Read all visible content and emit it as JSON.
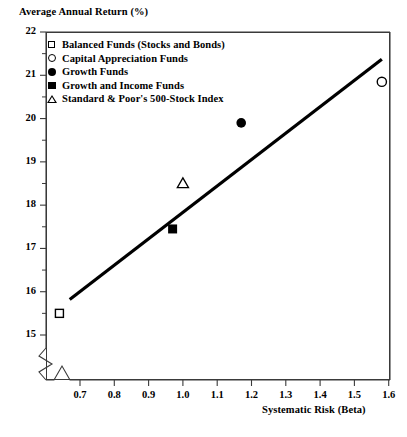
{
  "chart_data": {
    "type": "scatter",
    "title": "",
    "xlabel": "Systematic Risk (Beta)",
    "ylabel": "Average Annual Return (%)",
    "xlim": [
      0.63,
      1.6
    ],
    "ylim": [
      14.85,
      22
    ],
    "xticks": [
      "0.7",
      "0.8",
      "0.9",
      "1.0",
      "1.1",
      "1.2",
      "1.3",
      "1.4",
      "1.5",
      "1.6"
    ],
    "yticks": [
      "22",
      "21",
      "20",
      "19",
      "18",
      "17",
      "16",
      "15"
    ],
    "grid": false,
    "axis_break_x": true,
    "axis_break_y": true,
    "legend_position": "top-left",
    "series": [
      {
        "name": "Balanced Funds (Stocks and Bonds)",
        "marker": "open-square",
        "x": 0.64,
        "y": 15.5
      },
      {
        "name": "Capital Appreciation Funds",
        "marker": "open-circle",
        "x": 1.58,
        "y": 20.85
      },
      {
        "name": "Growth Funds",
        "marker": "filled-circle",
        "x": 1.17,
        "y": 19.9
      },
      {
        "name": "Growth and Income Funds",
        "marker": "filled-square",
        "x": 0.97,
        "y": 17.45
      },
      {
        "name": "Standard & Poor's 500-Stock Index",
        "marker": "open-triangle",
        "x": 1.0,
        "y": 18.5
      }
    ],
    "trendline": {
      "name": "regression-line",
      "x_start": 0.67,
      "y_start": 15.82,
      "x_end": 1.58,
      "y_end": 21.37
    },
    "colors": {
      "line": "#000000",
      "axis": "#3a3a3a",
      "marker": "#000000",
      "background": "#ffffff"
    }
  },
  "legend": {
    "items": [
      {
        "label": "Balanced Funds (Stocks and Bonds)",
        "marker": "open-square"
      },
      {
        "label": "Capital Appreciation Funds",
        "marker": "open-circle"
      },
      {
        "label": "Growth Funds",
        "marker": "filled-circle"
      },
      {
        "label": "Growth and Income Funds",
        "marker": "filled-square"
      },
      {
        "label": "Standard & Poor's 500-Stock Index",
        "marker": "open-triangle"
      }
    ]
  }
}
